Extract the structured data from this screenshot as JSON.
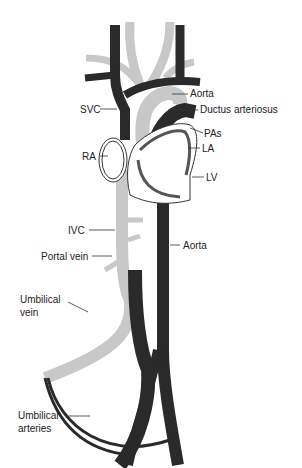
{
  "diagram": {
    "colors": {
      "dark": "#2a2a2a",
      "light": "#c8c8c8",
      "outline": "#333333",
      "heart_fill": "#ffffff"
    },
    "labels": {
      "aorta_top": "Aorta",
      "ductus": "Ductus arteriosus",
      "svc": "SVC",
      "pas": "PAs",
      "la": "LA",
      "ra": "RA",
      "lv": "LV",
      "ivc": "IVC",
      "aorta_bottom": "Aorta",
      "portal_vein": "Portal vein",
      "umbilical_vein_1": "Umbilical",
      "umbilical_vein_2": "vein",
      "umbilical_arteries_1": "Umbilical",
      "umbilical_arteries_2": "arteries"
    }
  }
}
